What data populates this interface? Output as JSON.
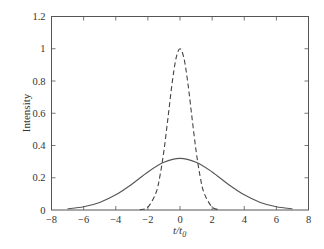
{
  "chart_data": {
    "type": "line",
    "title": "",
    "xlabel": "t/t0",
    "xlabel_main": "t/t",
    "xlabel_sub": "0",
    "ylabel": "Intensity",
    "xlim": [
      -8,
      8
    ],
    "ylim": [
      0,
      1.2
    ],
    "grid": false,
    "legend": null,
    "x_ticks": [
      -8,
      -6,
      -4,
      -2,
      0,
      2,
      4,
      6,
      8
    ],
    "x_tick_labels": [
      "−8",
      "−6",
      "−4",
      "−2",
      "0",
      "2",
      "4",
      "6",
      "8"
    ],
    "y_ticks": [
      0,
      0.2,
      0.4,
      0.6,
      0.8,
      1,
      1.2
    ],
    "y_tick_labels": [
      "0",
      "0.2",
      "0.4",
      "0.6",
      "0.8",
      "1",
      "1.2"
    ],
    "series": [
      {
        "name": "input pulse (dashed)",
        "style": "dashed",
        "x": [
          -2.5,
          -2,
          -1.5,
          -1.25,
          -1,
          -0.75,
          -0.5,
          -0.25,
          0,
          0.25,
          0.5,
          0.75,
          1,
          1.25,
          1.5,
          2,
          2.5
        ],
        "values": [
          0.002,
          0.018,
          0.105,
          0.21,
          0.368,
          0.57,
          0.779,
          0.939,
          1.0,
          0.939,
          0.779,
          0.57,
          0.368,
          0.21,
          0.105,
          0.018,
          0.002
        ]
      },
      {
        "name": "broadened pulse (solid)",
        "style": "solid",
        "x": [
          -7,
          -6,
          -5,
          -4,
          -3,
          -2,
          -1,
          0,
          1,
          2,
          3,
          4,
          5,
          6,
          7
        ],
        "values": [
          0.007,
          0.02,
          0.047,
          0.094,
          0.16,
          0.236,
          0.296,
          0.32,
          0.296,
          0.236,
          0.16,
          0.094,
          0.047,
          0.02,
          0.007
        ]
      }
    ]
  }
}
